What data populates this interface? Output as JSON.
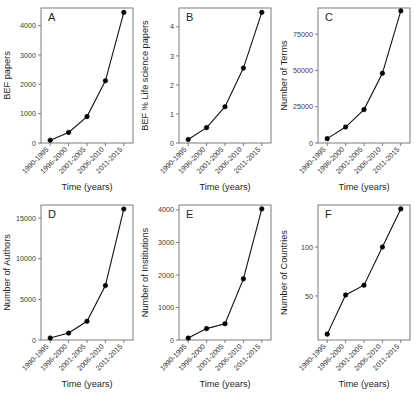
{
  "figure": {
    "background": "#ffffff",
    "series_color": "#111111",
    "axis_color": "#6e6e6e",
    "text_color": "#3a3a3a",
    "shared_xlabel": "Time (years)",
    "categories": [
      "1990-1995",
      "1996-2000",
      "2001-2005",
      "2006-2010",
      "2011-2015"
    ]
  },
  "chart_data": [
    {
      "type": "line",
      "panel": "A",
      "title": "",
      "xlabel": "Time (years)",
      "ylabel": "BEF papers",
      "categories": [
        "1990-1995",
        "1996-2000",
        "2001-2005",
        "2006-2010",
        "2011-2015"
      ],
      "values": [
        95,
        360,
        900,
        2120,
        4450
      ],
      "ylim": [
        0,
        4600
      ],
      "yticks": [
        0,
        1000,
        2000,
        3000,
        4000
      ],
      "ytick_labels": [
        "0",
        "1000",
        "2000",
        "3000",
        "4000"
      ],
      "grid": false,
      "legend": "none"
    },
    {
      "type": "line",
      "panel": "B",
      "title": "",
      "xlabel": "Time (years)",
      "ylabel": "BEF % Life science papers",
      "categories": [
        "1990-1995",
        "1996-2000",
        "2001-2005",
        "2006-2010",
        "2011-2015"
      ],
      "values": [
        0.12,
        0.53,
        1.25,
        2.58,
        4.5
      ],
      "ylim": [
        0,
        4.65
      ],
      "yticks": [
        0,
        1,
        2,
        3,
        4
      ],
      "ytick_labels": [
        "0",
        "1",
        "2",
        "3",
        "4"
      ],
      "grid": false,
      "legend": "none"
    },
    {
      "type": "line",
      "panel": "C",
      "title": "",
      "xlabel": "Time (years)",
      "ylabel": "Number of Terms",
      "categories": [
        "1990-1995",
        "1996-2000",
        "2001-2005",
        "2006-2010",
        "2011-2015"
      ],
      "values": [
        3000,
        11000,
        23000,
        48000,
        91000
      ],
      "ylim": [
        0,
        93000
      ],
      "yticks": [
        0,
        25000,
        50000,
        75000
      ],
      "ytick_labels": [
        "0",
        "25000",
        "50000",
        "75000"
      ],
      "grid": false,
      "legend": "none"
    },
    {
      "type": "line",
      "panel": "D",
      "title": "",
      "xlabel": "Time (years)",
      "ylabel": "Number of Authors",
      "categories": [
        "1990-1995",
        "1996-2000",
        "2001-2005",
        "2006-2010",
        "2011-2015"
      ],
      "values": [
        250,
        850,
        2300,
        6700,
        16100
      ],
      "ylim": [
        0,
        16600
      ],
      "yticks": [
        0,
        5000,
        10000,
        15000
      ],
      "ytick_labels": [
        "0",
        "5000",
        "10000",
        "15000"
      ],
      "grid": false,
      "legend": "none"
    },
    {
      "type": "line",
      "panel": "E",
      "title": "",
      "xlabel": "Time (years)",
      "ylabel": "Number of Institutions",
      "categories": [
        "1990-1995",
        "1996-2000",
        "2001-2005",
        "2006-2010",
        "2011-2015"
      ],
      "values": [
        60,
        350,
        500,
        1880,
        4030
      ],
      "ylim": [
        0,
        4150
      ],
      "yticks": [
        0,
        1000,
        2000,
        3000,
        4000
      ],
      "ytick_labels": [
        "0",
        "1000",
        "2000",
        "3000",
        "4000"
      ],
      "grid": false,
      "legend": "none"
    },
    {
      "type": "line",
      "panel": "F",
      "title": "",
      "xlabel": "Time (years)",
      "ylabel": "Number of Countries",
      "categories": [
        "1990-1995",
        "1996-2000",
        "2001-2005",
        "2006-2010",
        "2011-2015"
      ],
      "values": [
        11,
        51,
        61,
        100,
        139
      ],
      "ylim": [
        5,
        143
      ],
      "yticks": [
        50,
        100
      ],
      "ytick_labels": [
        "50",
        "100"
      ],
      "grid": false,
      "legend": "none"
    }
  ]
}
